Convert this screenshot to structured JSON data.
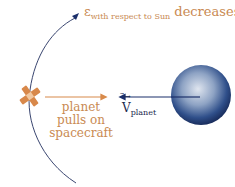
{
  "diagram": {
    "top_label": {
      "symbol": "ε",
      "subscript": "with respect to Sun",
      "word": "decreases"
    },
    "force_label": {
      "line1": "planet",
      "line2": "pulls on",
      "line3": "spacecraft"
    },
    "velocity_label": {
      "symbol": "V",
      "subscript": "planet"
    },
    "colors": {
      "trajectory": "#3a4670",
      "force_arrow": "#d88a4a",
      "velocity_arrow": "#1b2f6b",
      "label_orange": "#c98a52",
      "planet": "#2b4a86"
    }
  }
}
